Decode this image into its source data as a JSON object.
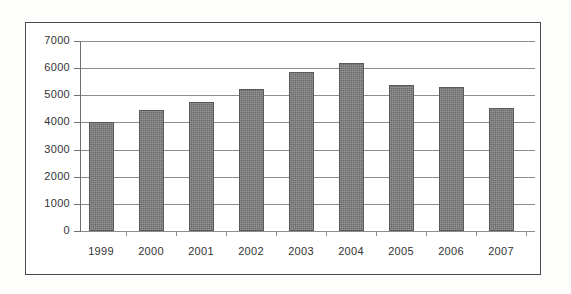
{
  "chart_data": {
    "type": "bar",
    "title": "",
    "subtitle": "",
    "xlabel": "",
    "ylabel": "",
    "categories": [
      "1999",
      "2000",
      "2001",
      "2002",
      "2003",
      "2004",
      "2005",
      "2006",
      "2007"
    ],
    "values": [
      4000,
      4440,
      4740,
      5220,
      5850,
      6200,
      5370,
      5320,
      4520
    ],
    "series": [
      {
        "name": "",
        "values": [
          4000,
          4440,
          4740,
          5220,
          5850,
          6200,
          5370,
          5320,
          4520
        ]
      }
    ],
    "ylim": [
      0,
      7000
    ],
    "ytick_labels": [
      "7000",
      "6000",
      "5000",
      "4000",
      "3000",
      "2000",
      "1000",
      "0"
    ],
    "ytick_values": [
      7000,
      6000,
      5000,
      4000,
      3000,
      2000,
      1000,
      0
    ],
    "ytick_step": 1000,
    "xtick_labels": [
      "1999",
      "2000",
      "2001",
      "2002",
      "2003",
      "2004",
      "2005",
      "2006",
      "2007"
    ],
    "grid": "horizontal",
    "legend": "none",
    "annotations": [],
    "bar_color": "#6b6b6b",
    "bar_border_color": "#585858",
    "gridline_color": "#8d8d8d",
    "axis_color": "#6f6f6f",
    "frame_color": "#4a4a4a",
    "text_color": "#333333",
    "background_color": "#ffffff"
  }
}
